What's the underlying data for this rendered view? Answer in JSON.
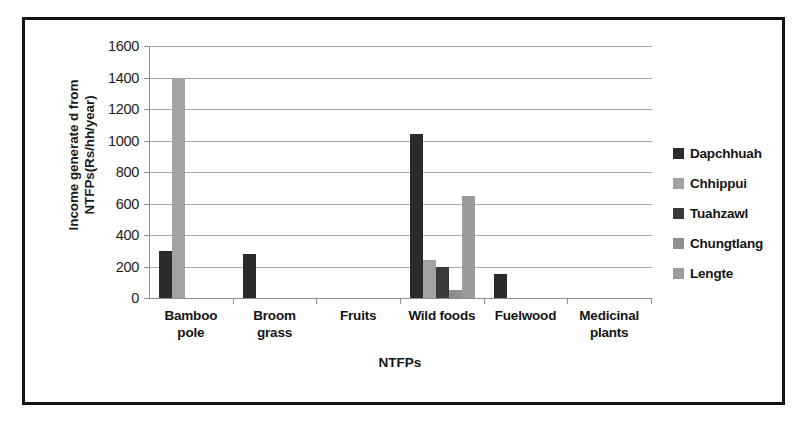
{
  "chart_data": {
    "type": "bar",
    "title": "",
    "xlabel": "NTFPs",
    "ylabel": "Income generate d from NTFPs(Rs/hh/year)",
    "ylabel_lines": [
      "Income generate d from",
      "NTFPs(Rs/hh/year)"
    ],
    "ylim": [
      0,
      1600
    ],
    "ytick_step": 200,
    "yticks": [
      1600,
      1400,
      1200,
      1000,
      800,
      600,
      400,
      200,
      0
    ],
    "ytick_labels": [
      "1600",
      "1400",
      "1200",
      "1000",
      "800",
      "600",
      "400",
      "200",
      "0"
    ],
    "grid": true,
    "legend_position": "right",
    "categories": [
      "Bamboo pole",
      "Broom grass",
      "Fruits",
      "Wild foods",
      "Fuelwood",
      "Medicinal plants"
    ],
    "category_lines": [
      [
        "Bamboo",
        "pole"
      ],
      [
        "Broom",
        "grass"
      ],
      [
        "Fruits"
      ],
      [
        "Wild foods"
      ],
      [
        "Fuelwood"
      ],
      [
        "Medicinal",
        "plants"
      ]
    ],
    "series": [
      {
        "name": "Dapchhuah",
        "color": "#2b2b2b",
        "values": [
          300,
          280,
          0,
          1040,
          150,
          0
        ]
      },
      {
        "name": "Chhippui",
        "color": "#a3a3a3",
        "values": [
          1400,
          0,
          0,
          240,
          0,
          0
        ]
      },
      {
        "name": "Tuahzawl",
        "color": "#3a3a3a",
        "values": [
          0,
          0,
          0,
          200,
          0,
          0
        ]
      },
      {
        "name": "Chungtlang",
        "color": "#8f8f8f",
        "values": [
          0,
          0,
          0,
          50,
          0,
          0
        ]
      },
      {
        "name": "Lengte",
        "color": "#9a9a9a",
        "values": [
          0,
          0,
          0,
          650,
          0,
          0
        ]
      }
    ]
  },
  "figure": {
    "border_color": "#141414",
    "background": "#ffffff",
    "axis_color": "#8d8d8d",
    "gridline_color": "#a8a8a8"
  }
}
